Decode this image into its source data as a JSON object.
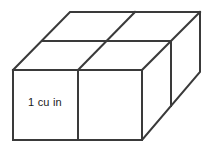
{
  "figure": {
    "label": "1 cu in",
    "unit_label": "1 cu in",
    "line_color": "#3a3a3a",
    "fill_color": "#ffffff",
    "background_color": "#ffffff",
    "text_color": "#1a1a1a",
    "shape_type": "rectangular prism",
    "unit_cube_count": "8",
    "dimensions": {
      "width_units": "2",
      "height_units": "1",
      "depth_units": "2"
    },
    "geometry": {
      "front_face": "13,70 142,70 142,140 13,140",
      "top_face": "13,70 70,12 200,12 142,70",
      "right_face": "142,70 200,12 200,72 142,140",
      "front_vertical_divider": "78,70 78,140",
      "top_horizontal_divider": "42,41 171,41",
      "top_diagonal_divider": "135,12 78,70",
      "right_vertical_divider": "171,41 171,106"
    }
  }
}
